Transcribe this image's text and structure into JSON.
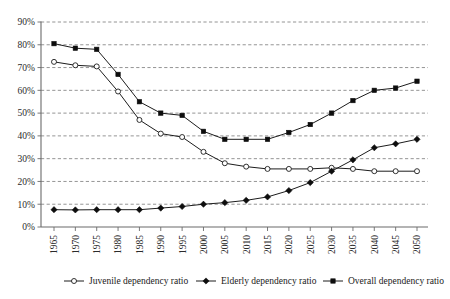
{
  "chart_data": {
    "type": "line",
    "title": "",
    "xlabel": "",
    "ylabel": "",
    "grid": true,
    "legend_position": "bottom",
    "ylim": [
      0,
      90
    ],
    "ytick_labels": [
      "0%",
      "10%",
      "20%",
      "30%",
      "40%",
      "50%",
      "60%",
      "70%",
      "80%",
      "90%"
    ],
    "ytick_values": [
      0,
      10,
      20,
      30,
      40,
      50,
      60,
      70,
      80,
      90
    ],
    "categories": [
      "1965",
      "1970",
      "1975",
      "1980",
      "1985",
      "1990",
      "1995",
      "2000",
      "2005",
      "2010",
      "2015",
      "2020",
      "2025",
      "2030",
      "2035",
      "2040",
      "2045",
      "2050"
    ],
    "x": [
      1965,
      1970,
      1975,
      1980,
      1985,
      1990,
      1995,
      2000,
      2005,
      2010,
      2015,
      2020,
      2025,
      2030,
      2035,
      2040,
      2045,
      2050
    ],
    "series": [
      {
        "name": "Juvenile dependency ratio",
        "marker": "open-circle",
        "values": [
          72.5,
          71.0,
          70.5,
          59.5,
          47.0,
          41.0,
          39.5,
          33.0,
          28.0,
          26.5,
          25.5,
          25.5,
          25.5,
          26.0,
          25.5,
          24.5,
          24.5,
          24.5
        ]
      },
      {
        "name": "Elderly dependency ratio",
        "marker": "filled-diamond",
        "values": [
          7.6,
          7.5,
          7.6,
          7.6,
          7.6,
          8.3,
          9.0,
          10.0,
          10.7,
          11.7,
          13.2,
          16.0,
          19.5,
          24.5,
          29.5,
          34.8,
          36.5,
          38.5
        ]
      },
      {
        "name": "Overall dependency ratio",
        "marker": "filled-square",
        "values": [
          80.5,
          78.5,
          78.0,
          67.0,
          55.0,
          50.0,
          49.0,
          42.0,
          38.5,
          38.5,
          38.5,
          41.5,
          45.0,
          50.0,
          55.5,
          60.0,
          61.0,
          64.0
        ]
      }
    ],
    "legend": [
      {
        "label": "Juvenile dependency ratio",
        "marker": "open-circle"
      },
      {
        "label": "Elderly dependency ratio",
        "marker": "filled-diamond"
      },
      {
        "label": "Overall dependency ratio",
        "marker": "filled-square"
      }
    ],
    "colors": {
      "line": "#1c1c1c",
      "grid": "#7a7a7a",
      "axis": "#6b6b6b",
      "background": "#ffffff"
    }
  }
}
